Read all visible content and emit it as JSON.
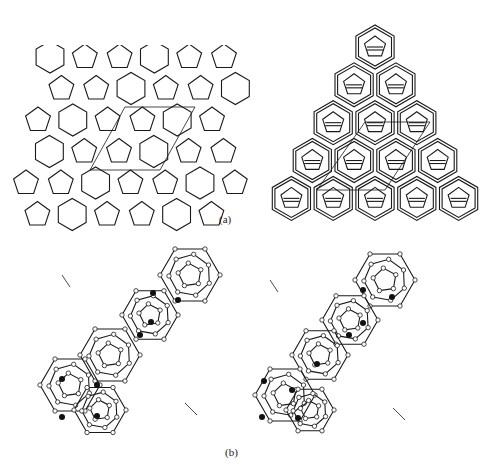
{
  "figure": {
    "panels": [
      {
        "id": "a-left",
        "description": "2D tiling of pentagons and hexagons with unit-cell rhombus overlay"
      },
      {
        "id": "a-right",
        "description": "Triangular projection of polyhedral cage framework with unit-cell rhombus overlay"
      },
      {
        "id": "b-left",
        "description": "Stereo view left: cage clusters with open-circle framework atoms and filled guest atoms inside unit-cell box"
      },
      {
        "id": "b-right",
        "description": "Stereo view right: cage clusters with open-circle framework atoms and filled guest atoms inside unit-cell box"
      }
    ],
    "labels": {
      "a": "(a)",
      "b": "(b)"
    },
    "colors": {
      "line": "#1a1a1a",
      "background": "#ffffff",
      "guest_atom": "#111111",
      "framework_atom": "#ffffff"
    }
  }
}
